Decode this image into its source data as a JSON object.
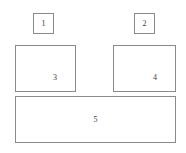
{
  "diagram": {
    "canvas": {
      "width": 186,
      "height": 153,
      "background_color": "#ffffff",
      "border_color": "#8a8a8a",
      "label_color": "#3a3a3a"
    },
    "regions": [
      {
        "id": "region-1",
        "label": "1",
        "shape": "square",
        "x": 33,
        "y": 13,
        "width": 21,
        "height": 21,
        "label_position": "center"
      },
      {
        "id": "region-2",
        "label": "2",
        "shape": "square",
        "x": 134,
        "y": 13,
        "width": 21,
        "height": 21,
        "label_position": "center"
      },
      {
        "id": "region-3",
        "label": "3",
        "shape": "rectangle",
        "x": 15,
        "y": 45,
        "width": 61,
        "height": 47,
        "label_position": "lower-right"
      },
      {
        "id": "region-4",
        "label": "4",
        "shape": "rectangle",
        "x": 113,
        "y": 45,
        "width": 63,
        "height": 47,
        "label_position": "lower-right"
      },
      {
        "id": "region-5",
        "label": "5",
        "shape": "rectangle",
        "x": 15,
        "y": 96,
        "width": 161,
        "height": 47,
        "label_position": "center"
      }
    ]
  }
}
